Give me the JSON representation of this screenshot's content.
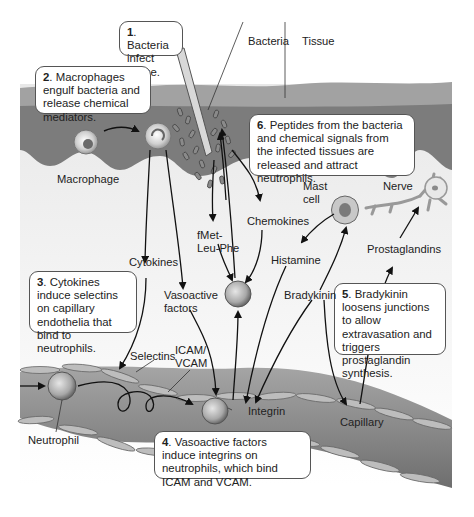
{
  "figure": {
    "palette": {
      "background": "#ffffff",
      "outer_tissue": "#9a9a9a",
      "inner_tissue": "#7e7e7e",
      "interstitial": "#ececec",
      "capillary_lumen": "#8a8a8a",
      "endothelial_cell": "#b8b8b8",
      "arrow": "#111111",
      "callout_border": "#555555"
    }
  },
  "callouts": [
    {
      "num": "1",
      "text": ". Bacteria infect tissue."
    },
    {
      "num": "2",
      "text": ". Macrophages engulf bacteria and release chemical mediators."
    },
    {
      "num": "3",
      "text": ". Cytokines induce selectins on capillary endothelia that bind to neutrophils."
    },
    {
      "num": "4",
      "text": ". Vasoactive factors induce integrins on neutrophils, which bind ICAM and VCAM."
    },
    {
      "num": "5",
      "text": ". Bradykinin loosens junctions to allow extravasation and triggers prostaglandin synthesis."
    },
    {
      "num": "6",
      "text": ". Peptides from the bacteria and chemical signals from the infected tissues are released and attract neutrophils."
    }
  ],
  "labels": {
    "bacteria": "Bacteria",
    "tissue": "Tissue",
    "macrophage": "Macrophage",
    "mast_cell_1": "Mast",
    "mast_cell_2": "cell",
    "nerve": "Nerve",
    "fmet_1": "fMet-",
    "fmet_2": "Leu-Phe",
    "chemokines": "Chemokines",
    "cytokines": "Cytokines",
    "histamine": "Histamine",
    "prostaglandins": "Prostaglandins",
    "bradykinin": "Bradykinin",
    "vasoactive_1": "Vasoactive",
    "vasoactive_2": "factors",
    "selectins": "Selectins",
    "icam_1": "ICAM/",
    "icam_2": "VCAM",
    "integrin": "Integrin",
    "capillary": "Capillary",
    "neutrophil": "Neutrophil"
  }
}
